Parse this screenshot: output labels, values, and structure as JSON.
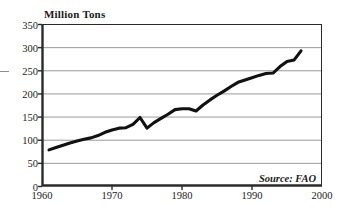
{
  "figure": {
    "y_axis_title": "Million Tons",
    "source_credit": "Source: FAO",
    "background_color": "#ffffff",
    "line_color": "#111111",
    "grid_color": "#9a9a9a",
    "axis_color": "#2a2a2a"
  },
  "chart_data": {
    "type": "line",
    "title": "",
    "subtitle": "",
    "xlabel": "",
    "ylabel": "Million Tons",
    "xlim": [
      1960,
      2000
    ],
    "ylim": [
      0,
      350
    ],
    "grid": true,
    "legend": false,
    "annotations": [
      "Source: FAO"
    ],
    "xticks": [
      1960,
      1970,
      1980,
      1990,
      2000
    ],
    "xtick_labels": [
      "1960",
      "1970",
      "1980",
      "1990",
      "2000"
    ],
    "yticks": [
      0,
      50,
      100,
      150,
      200,
      250,
      300,
      350
    ],
    "ytick_labels": [
      "0",
      "50",
      "100",
      "150",
      "200",
      "250",
      "300",
      "350"
    ],
    "series": [
      {
        "name": "Production",
        "x": [
          1961,
          1962,
          1963,
          1964,
          1965,
          1966,
          1967,
          1968,
          1969,
          1970,
          1971,
          1972,
          1973,
          1974,
          1975,
          1976,
          1977,
          1978,
          1979,
          1980,
          1981,
          1982,
          1983,
          1984,
          1985,
          1986,
          1987,
          1988,
          1989,
          1990,
          1991,
          1992,
          1993,
          1994,
          1995,
          1996,
          1997
        ],
        "values": [
          78,
          83,
          88,
          93,
          97,
          101,
          104,
          109,
          116,
          121,
          125,
          126,
          133,
          148,
          125,
          137,
          146,
          155,
          165,
          167,
          167,
          162,
          175,
          186,
          196,
          205,
          215,
          224,
          229,
          234,
          239,
          243,
          244,
          258,
          269,
          272,
          292
        ]
      }
    ]
  }
}
